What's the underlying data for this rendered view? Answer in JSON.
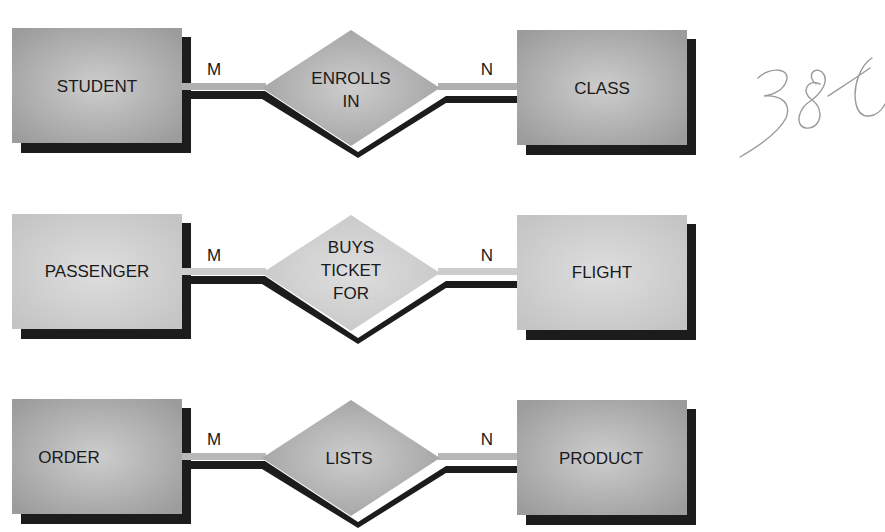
{
  "diagram": {
    "type": "entity-relationship",
    "colors": {
      "background": "#ffffff",
      "shadow": "#1c1c1c",
      "entity_fill_dark": "#a8a8a8",
      "entity_fill_light": "#cfcfcf",
      "entity_highlight": "#e2e2e2",
      "text": "#1a1a1a",
      "annotation_pencil": "#9a9a9a"
    },
    "relationships": [
      {
        "left_entity": "STUDENT",
        "left_cardinality": "M",
        "relationship": [
          "ENROLLS",
          "IN"
        ],
        "right_cardinality": "N",
        "right_entity": "CLASS",
        "tone": "dark"
      },
      {
        "left_entity": "PASSENGER",
        "left_cardinality": "M",
        "relationship": [
          "BUYS",
          "TICKET",
          "FOR"
        ],
        "right_cardinality": "N",
        "right_entity": "FLIGHT",
        "tone": "light"
      },
      {
        "left_entity": "ORDER",
        "left_cardinality": "M",
        "relationship": [
          "LISTS"
        ],
        "right_cardinality": "N",
        "right_entity": "PRODUCT",
        "tone": "dark"
      }
    ],
    "annotation": "386"
  }
}
